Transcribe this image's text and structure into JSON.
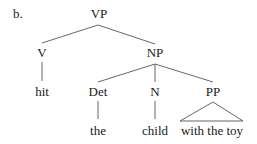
{
  "figure": {
    "label": "b.",
    "colors": {
      "text": "#1a1a1a",
      "line": "#555555",
      "background": "#ffffff"
    }
  },
  "tree": {
    "root": "VP",
    "nodes": {
      "vp": {
        "label": "VP",
        "x": 99,
        "y": 18
      },
      "v": {
        "label": "V",
        "x": 42,
        "y": 57
      },
      "np": {
        "label": "NP",
        "x": 155,
        "y": 57
      },
      "hit": {
        "label": "hit",
        "x": 42,
        "y": 96
      },
      "det": {
        "label": "Det",
        "x": 98,
        "y": 96
      },
      "n": {
        "label": "N",
        "x": 155,
        "y": 96
      },
      "pp": {
        "label": "PP",
        "x": 213,
        "y": 96
      },
      "the": {
        "label": "the",
        "x": 98,
        "y": 135
      },
      "child": {
        "label": "child",
        "x": 155,
        "y": 135
      },
      "with_the_toy": {
        "label": "with the toy",
        "x": 212,
        "y": 135
      }
    },
    "edges": [
      [
        "VP",
        "V"
      ],
      [
        "VP",
        "NP"
      ],
      [
        "V",
        "hit"
      ],
      [
        "NP",
        "Det"
      ],
      [
        "NP",
        "N"
      ],
      [
        "NP",
        "PP"
      ],
      [
        "Det",
        "the"
      ],
      [
        "N",
        "child"
      ],
      [
        "PP",
        "with the toy (triangle)"
      ]
    ]
  }
}
